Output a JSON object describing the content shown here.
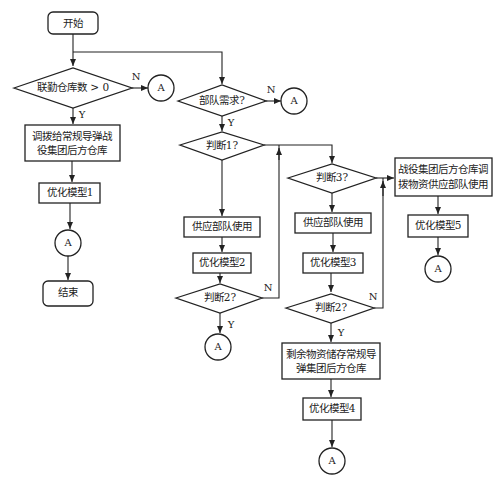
{
  "flowchart": {
    "start": "开始",
    "end": "结束",
    "connector": "A",
    "decisions": {
      "linked_warehouses": "联勤仓库数 > 0",
      "troop_demand": "部队需求?",
      "judge1": "判断1?",
      "judge2_left": "判断2?",
      "judge3": "判断3?",
      "judge2_mid": "判断2?"
    },
    "processes": {
      "allocate_line1": "调拨给常规导弹战",
      "allocate_line2": "役集团后方仓库",
      "opt_model1": "优化模型1",
      "supply_troops_left": "供应部队使用",
      "opt_model2": "优化模型2",
      "supply_troops_mid": "供应部队使用",
      "opt_model3": "优化模型3",
      "remaining_line1": "剩余物资储存常规导",
      "remaining_line2": "弹集团后方仓库",
      "opt_model4": "优化模型4",
      "campaign_line1": "战役集团后方仓库调",
      "campaign_line2": "拨物资供应部队使用",
      "opt_model5": "优化模型5"
    },
    "labels": {
      "yes": "Y",
      "no": "N"
    }
  }
}
